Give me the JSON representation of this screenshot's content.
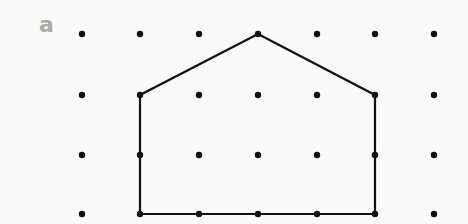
{
  "figure": {
    "label": "a",
    "label_color": "#a8a8a8",
    "background": "#fafafa",
    "line_color": "#111111",
    "dot_color": "#111111"
  },
  "grid": {
    "columns": 7,
    "rows": 4,
    "x": [
      82,
      140,
      199,
      258,
      317,
      375,
      434
    ],
    "y": [
      34,
      95,
      155,
      214
    ]
  },
  "shape": {
    "name": "pentagon-house",
    "vertices_grid": [
      [
        1,
        3
      ],
      [
        1,
        1
      ],
      [
        3,
        0
      ],
      [
        5,
        1
      ],
      [
        5,
        3
      ]
    ],
    "description": "Closed pentagon: rectangle 4 units wide x 2 units high with triangular roof peak 1 unit above"
  }
}
